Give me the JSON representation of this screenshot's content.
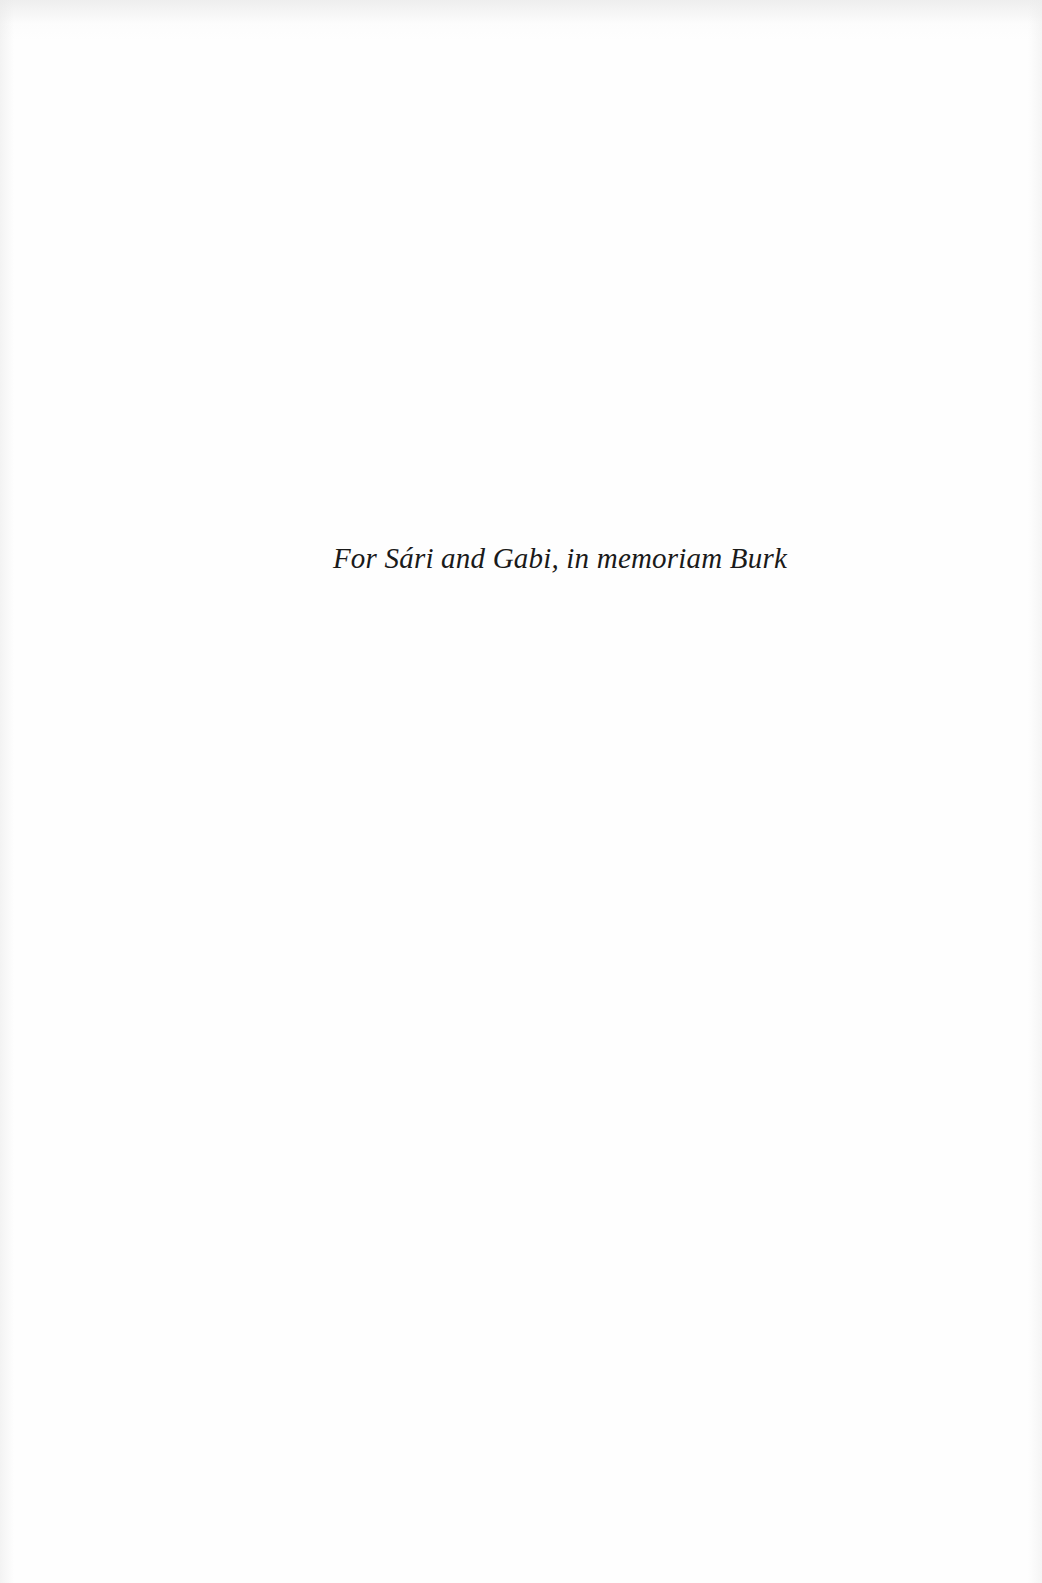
{
  "page": {
    "type": "dedication",
    "background_color": "#fefefe",
    "text_color": "#1a1a1a",
    "dedication_text": "For Sári and Gabi, in memoriam Burk"
  }
}
